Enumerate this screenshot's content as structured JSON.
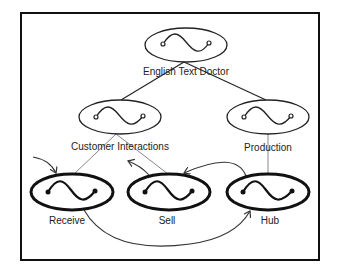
{
  "diagram": {
    "nodes": [
      {
        "id": "english-text-doctor",
        "label": "English Text Doctor",
        "cx": 186,
        "cy": 45,
        "style": "thin"
      },
      {
        "id": "customer-interactions",
        "label": "Customer Interactions",
        "cx": 120,
        "cy": 117,
        "style": "thin"
      },
      {
        "id": "production",
        "label": "Production",
        "cx": 268,
        "cy": 117,
        "style": "thin"
      },
      {
        "id": "receive",
        "label": "Receive",
        "cx": 72,
        "cy": 192,
        "style": "bold"
      },
      {
        "id": "sell",
        "label": "Sell",
        "cx": 169,
        "cy": 192,
        "style": "bold"
      },
      {
        "id": "hub",
        "label": "Hub",
        "cx": 268,
        "cy": 192,
        "style": "bold"
      }
    ],
    "hierarchy_edges": [
      {
        "from": "english-text-doctor",
        "to": "customer-interactions"
      },
      {
        "from": "english-text-doctor",
        "to": "production"
      },
      {
        "from": "customer-interactions",
        "to": "receive"
      },
      {
        "from": "customer-interactions",
        "to": "sell"
      },
      {
        "from": "production",
        "to": "hub"
      }
    ],
    "flow_edges": [
      {
        "from": "external",
        "to": "receive"
      },
      {
        "from": "sell",
        "to": "external"
      },
      {
        "from": "hub",
        "to": "sell"
      },
      {
        "from": "receive",
        "to": "hub"
      }
    ],
    "colors": {
      "frame": "#111111",
      "thin_node": "#222222",
      "bold_node": "#111111",
      "hierarchy_line": "#888888",
      "flow_line": "#333333"
    }
  }
}
